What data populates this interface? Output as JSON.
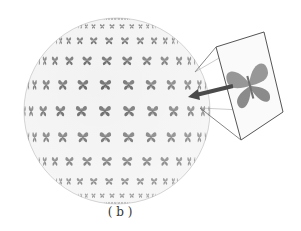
{
  "figure": {
    "caption": "( b )",
    "sphere": {
      "cx": 117,
      "cy": 111,
      "r": 93,
      "tile_rows": 11,
      "tile_cols": 12
    },
    "texture_box": {
      "points": [
        [
          216,
          47
        ],
        [
          264,
          32
        ],
        [
          283,
          112
        ],
        [
          241,
          140
        ]
      ]
    },
    "arrow": {
      "from": [
        233,
        86
      ],
      "to": [
        190,
        97
      ]
    },
    "colors": {
      "butterfly": "#6f6f6f",
      "butterfly_light": "#a8a8a8",
      "line": "#555555",
      "arrow": "#4a4a4a",
      "background": "#ffffff"
    }
  }
}
